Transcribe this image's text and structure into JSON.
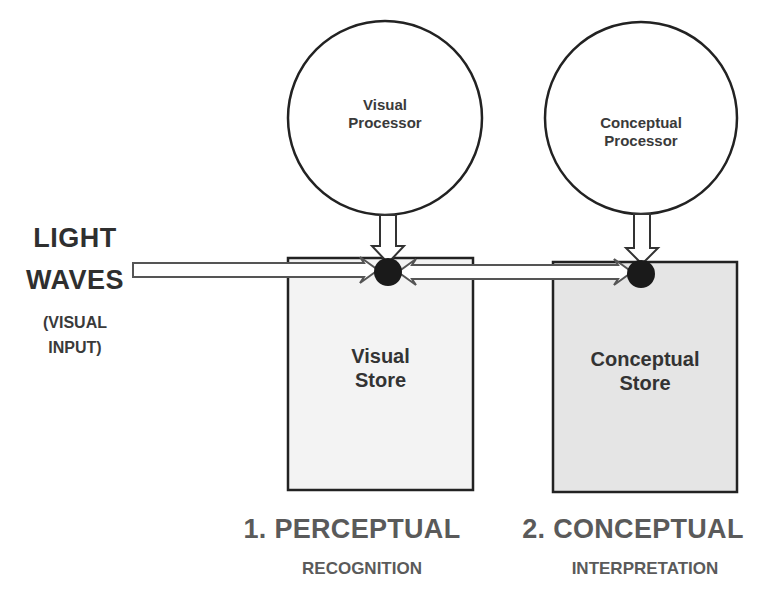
{
  "input": {
    "line1": "LIGHT",
    "line2": "WAVES",
    "sub_line1": "(VISUAL",
    "sub_line2": "INPUT)"
  },
  "processors": [
    {
      "line1": "Visual",
      "line2": "Processor"
    },
    {
      "line1": "Conceptual",
      "line2": "Processor"
    }
  ],
  "stores": [
    {
      "line1": "Visual",
      "line2": "Store",
      "fill": "#f3f3f3"
    },
    {
      "line1": "Conceptual",
      "line2": "Store",
      "fill": "#e5e5e5"
    }
  ],
  "stages": [
    {
      "title": "1. PERCEPTUAL",
      "subtitle": "RECOGNITION"
    },
    {
      "title": "2. CONCEPTUAL",
      "subtitle": "INTERPRETATION"
    }
  ],
  "colors": {
    "stroke": "#222222",
    "node": "#1a1a1a",
    "arrow_fill": "#ffffff",
    "arrow_stroke": "#444444"
  }
}
